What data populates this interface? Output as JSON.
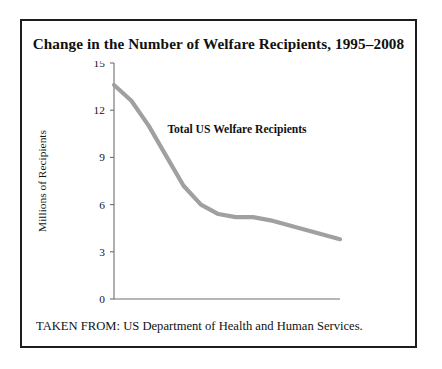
{
  "figure": {
    "title": "Change in the Number of Welfare Recipients, 1995–2008",
    "source": "TAKEN FROM: US Department of Health and Human Services."
  },
  "chart_data": {
    "type": "line",
    "title": "Change in the Number of Welfare Recipients, 1995–2008",
    "xlabel": "",
    "ylabel": "Millions of Recipients",
    "annotation": "Total US Welfare Recipients",
    "x": [
      "1995",
      "1996",
      "1997",
      "1998",
      "1999",
      "2000",
      "2001",
      "2002",
      "2003",
      "2004",
      "2005",
      "2006",
      "2007",
      "2008"
    ],
    "tick_labels": [
      "'95",
      "'97",
      "'99",
      "'01",
      "'03",
      "'05",
      "'07",
      "'08"
    ],
    "tick_values": [
      "1995",
      "1997",
      "1999",
      "2001",
      "2003",
      "2005",
      "2007",
      "2008"
    ],
    "values": [
      13.6,
      12.6,
      11.0,
      9.1,
      7.2,
      6.0,
      5.4,
      5.2,
      5.2,
      5.0,
      4.7,
      4.4,
      4.1,
      3.8
    ],
    "series": [
      {
        "name": "Total US Welfare Recipients",
        "values": [
          13.6,
          12.6,
          11.0,
          9.1,
          7.2,
          6.0,
          5.4,
          5.2,
          5.2,
          5.0,
          4.7,
          4.4,
          4.1,
          3.8
        ],
        "color": "#a0a0a0"
      }
    ],
    "y_ticks": [
      0,
      3,
      6,
      9,
      12,
      15
    ],
    "ylim": [
      0,
      15
    ],
    "xlim": [
      "1995",
      "2008"
    ],
    "grid": false,
    "legend": "none",
    "line_color": "#a0a0a0",
    "axis_color": "#6f6f6f"
  }
}
